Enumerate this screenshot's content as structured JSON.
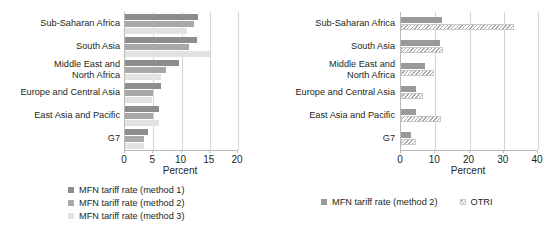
{
  "chart_data": [
    {
      "type": "bar",
      "orientation": "horizontal",
      "panel": "left",
      "title": "",
      "xlabel": "Percent",
      "ylabel": "",
      "xlim": [
        0,
        20
      ],
      "xticks": [
        0,
        5,
        10,
        15,
        20
      ],
      "grid": true,
      "legend_position": "bottom",
      "categories": [
        "Sub-Saharan  Africa",
        "South Asia",
        "Middle East and\nNorth Africa",
        "Europe and Central Asia",
        "East Asia and Pacific",
        "G7"
      ],
      "series": [
        {
          "name": "MFN tariff rate (method 1)",
          "color": "#8d8d8d",
          "values": [
            13.0,
            12.7,
            9.5,
            6.3,
            6.1,
            4.0
          ]
        },
        {
          "name": "MFN tariff rate (method 2)",
          "color": "#a8a8a8",
          "values": [
            12.2,
            11.3,
            7.2,
            4.9,
            4.9,
            3.4
          ]
        },
        {
          "name": "MFN tariff rate (method 3)",
          "color": "#e2e2e2",
          "values": [
            10.9,
            15.0,
            6.3,
            4.8,
            6.1,
            3.4
          ]
        }
      ]
    },
    {
      "type": "bar",
      "orientation": "horizontal",
      "panel": "right",
      "title": "",
      "xlabel": "Percent",
      "ylabel": "",
      "xlim": [
        0,
        40
      ],
      "xticks": [
        0,
        10,
        20,
        30,
        40
      ],
      "grid": true,
      "legend_position": "bottom",
      "categories": [
        "Sub-Saharan  Africa",
        "South Asia",
        "Middle East and\nNorth Africa",
        "Europe and Central Asia",
        "East Asia and Pacific",
        "G7"
      ],
      "series": [
        {
          "name": "MFN tariff rate (method 2)",
          "color": "#9a9a9a",
          "values": [
            12.0,
            11.3,
            7.0,
            4.5,
            4.5,
            3.0
          ]
        },
        {
          "name": "OTRI",
          "color": "#f2f2f2",
          "pattern": "diagonal-hatch",
          "values": [
            33.0,
            12.3,
            9.5,
            6.3,
            11.8,
            4.5
          ]
        }
      ]
    }
  ],
  "left_chart": {
    "categories": [
      {
        "label": "Sub-Saharan  Africa"
      },
      {
        "label": "South Asia"
      },
      {
        "label": "Middle East and\nNorth Africa"
      },
      {
        "label": "Europe and Central Asia"
      },
      {
        "label": "East Asia and Pacific"
      },
      {
        "label": "G7"
      }
    ],
    "ticks": [
      {
        "label": "0"
      },
      {
        "label": "5"
      },
      {
        "label": "10"
      },
      {
        "label": "15"
      },
      {
        "label": "20"
      }
    ],
    "axis_title": "Percent",
    "legend": [
      {
        "label": "MFN tariff rate (method 1)"
      },
      {
        "label": "MFN tariff rate (method 2)"
      },
      {
        "label": "MFN tariff rate (method 3)"
      }
    ]
  },
  "right_chart": {
    "categories": [
      {
        "label": "Sub-Saharan  Africa"
      },
      {
        "label": "South Asia"
      },
      {
        "label": "Middle East and\nNorth Africa"
      },
      {
        "label": "Europe and Central Asia"
      },
      {
        "label": "East Asia and Pacific"
      },
      {
        "label": "G7"
      }
    ],
    "ticks": [
      {
        "label": "0"
      },
      {
        "label": "10"
      },
      {
        "label": "20"
      },
      {
        "label": "30"
      },
      {
        "label": "40"
      }
    ],
    "axis_title": "Percent",
    "legend": [
      {
        "label": "MFN tariff rate (method 2)"
      },
      {
        "label": "OTRI"
      }
    ]
  }
}
